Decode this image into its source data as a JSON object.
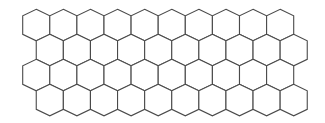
{
  "diagram": {
    "type": "hexagonal-grid",
    "orientation": "pointy-top",
    "rows": 4,
    "columns": 10,
    "colors": {
      "background": "#ffffff",
      "stroke": "#4a4a4a",
      "fill": "#ffffff"
    },
    "geometry": {
      "origin_x": 22.7,
      "origin_y": 9.3,
      "hex_width": 27.1,
      "cap_height": 6.5,
      "side_height": 18.5,
      "row_pitch": 25,
      "odd_row_offset": 13.55
    }
  }
}
